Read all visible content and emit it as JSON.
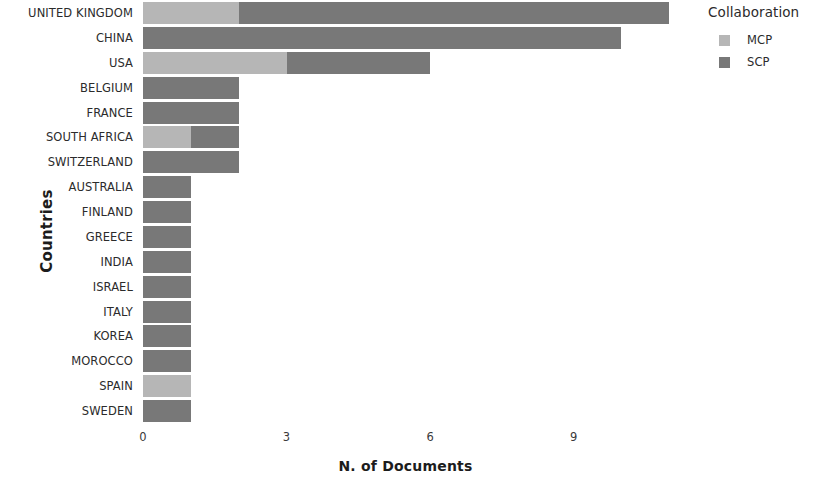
{
  "chart_data": {
    "type": "bar",
    "orientation": "horizontal",
    "stacked": true,
    "title": "",
    "xlabel": "N. of Documents",
    "ylabel": "Countries",
    "xlim": [
      0,
      11.6
    ],
    "xticks": [
      0,
      3,
      6,
      9
    ],
    "xtick_labels": [
      "0",
      "3",
      "6",
      "9"
    ],
    "grid": false,
    "legend": {
      "title": "Collaboration",
      "position": "right",
      "entries": [
        {
          "name": "MCP",
          "color": "#b6b6b6"
        },
        {
          "name": "SCP",
          "color": "#787878"
        }
      ]
    },
    "categories": [
      "UNITED KINGDOM",
      "CHINA",
      "USA",
      "BELGIUM",
      "FRANCE",
      "SOUTH AFRICA",
      "SWITZERLAND",
      "AUSTRALIA",
      "FINLAND",
      "GREECE",
      "INDIA",
      "ISRAEL",
      "ITALY",
      "KOREA",
      "MOROCCO",
      "SPAIN",
      "SWEDEN"
    ],
    "series": [
      {
        "name": "MCP",
        "color": "#b6b6b6",
        "values": [
          2,
          0,
          3,
          0,
          0,
          1,
          0,
          0,
          0,
          0,
          0,
          0,
          0,
          0,
          0,
          1,
          0
        ]
      },
      {
        "name": "SCP",
        "color": "#787878",
        "values": [
          9,
          10,
          3,
          2,
          2,
          1,
          2,
          1,
          1,
          1,
          1,
          1,
          1,
          1,
          1,
          0,
          1
        ]
      }
    ],
    "totals": [
      11,
      10,
      6,
      2,
      2,
      2,
      2,
      1,
      1,
      1,
      1,
      1,
      1,
      1,
      1,
      1,
      1
    ]
  }
}
